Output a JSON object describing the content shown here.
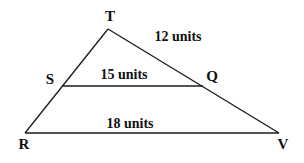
{
  "diagram": {
    "type": "triangle-with-parallel-segment",
    "colors": {
      "stroke": "#1a1a1a",
      "text": "#111111",
      "background": "#ffffff"
    },
    "vertices": {
      "T": {
        "label": "T",
        "x": 108,
        "y": 29,
        "lx": 110,
        "ly": 21
      },
      "S": {
        "label": "S",
        "x": 63,
        "y": 86,
        "lx": 50,
        "ly": 84
      },
      "Q": {
        "label": "Q",
        "x": 203,
        "y": 86,
        "lx": 212,
        "ly": 81
      },
      "R": {
        "label": "R",
        "x": 25,
        "y": 133,
        "lx": 24,
        "ly": 149
      },
      "V": {
        "label": "V",
        "x": 279,
        "y": 133,
        "lx": 283,
        "ly": 149
      }
    },
    "segments": {
      "TQ": {
        "label": "12 units",
        "lx": 178,
        "ly": 41
      },
      "SQ": {
        "label": "15 units",
        "lx": 124,
        "ly": 79
      },
      "RV": {
        "label": "18 units",
        "lx": 130,
        "ly": 128
      }
    }
  }
}
